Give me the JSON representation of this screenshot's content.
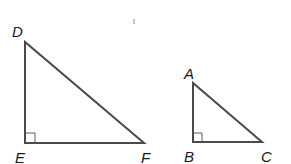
{
  "diagram": {
    "type": "similar right triangles",
    "stroke_color": "#4a4a4a",
    "label_color": "#1a1a1a",
    "triangles": [
      {
        "name": "DEF",
        "right_angle_at": "E",
        "vertices": {
          "D": {
            "label": "D",
            "x": 25,
            "y": 42
          },
          "E": {
            "label": "E",
            "x": 25,
            "y": 143
          },
          "F": {
            "label": "F",
            "x": 144,
            "y": 143
          }
        }
      },
      {
        "name": "ABC",
        "right_angle_at": "B",
        "vertices": {
          "A": {
            "label": "A",
            "x": 193,
            "y": 83
          },
          "B": {
            "label": "B",
            "x": 193,
            "y": 142
          },
          "C": {
            "label": "C",
            "x": 262,
            "y": 142
          }
        }
      }
    ]
  }
}
